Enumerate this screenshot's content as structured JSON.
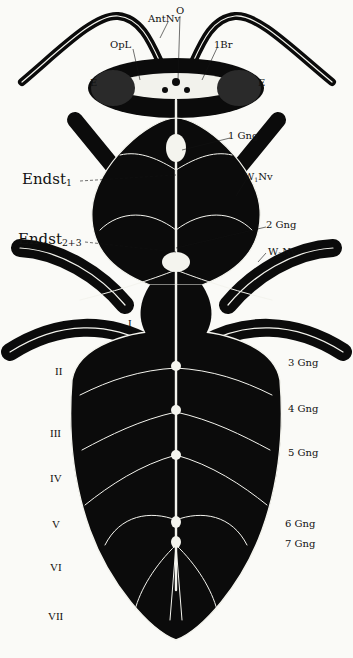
{
  "figure": {
    "colors": {
      "body": "#0b0b0b",
      "nerve": "#f4f4ee",
      "paper": "#fafaf7",
      "ink": "#111111"
    }
  },
  "labels": {
    "head": {
      "antenna_nerve": "AntNv",
      "ocellus": "O",
      "optic_lobe": "OpL",
      "brain": "1Br",
      "eye_left": "E",
      "eye_right": "E"
    },
    "thorax": {
      "ganglion_1": "1 Gng",
      "endosternite_1_base": "Endst",
      "endosternite_1_sub": "1",
      "wing_nerve_1_base": "W",
      "wing_nerve_1_sub": "1",
      "wing_nerve_1_suffix": "Nv",
      "ganglion_2": "2 Gng",
      "endosternite_23_base": "Endst",
      "endosternite_23_sub": "2+3",
      "wing_nerve_2_base": "W",
      "wing_nerve_2_sub": "2",
      "wing_nerve_2_suffix": "Nv"
    },
    "abdomen": {
      "ganglia": [
        "3 Gng",
        "4 Gng",
        "5 Gng",
        "6 Gng",
        "7 Gng"
      ],
      "segments": [
        "I",
        "II",
        "III",
        "IV",
        "V",
        "VI",
        "VII"
      ]
    }
  }
}
